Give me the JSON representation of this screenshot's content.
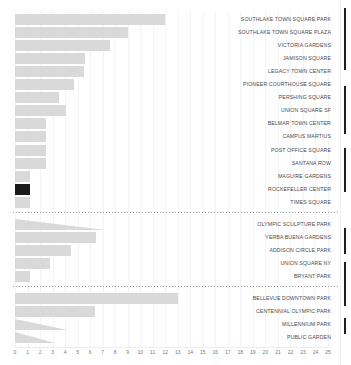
{
  "chart_data": {
    "type": "bar",
    "orientation": "horizontal",
    "title": "",
    "xlabel": "",
    "ylabel": "",
    "xlim": [
      0,
      25
    ],
    "grid": true,
    "legend": null,
    "tick_step": 1,
    "tick_labels": [
      "0",
      "1",
      "2",
      "3",
      "4",
      "5",
      "6",
      "7",
      "8",
      "9",
      "10",
      "11",
      "12",
      "13",
      "14",
      "15",
      "16",
      "17",
      "18",
      "19",
      "20",
      "21",
      "22",
      "23",
      "24",
      "25"
    ],
    "categories": [
      "SOUTHLAKE TOWN SQUARE PARK",
      "SOUTHLAKE TOWN SQUARE PLAZA",
      "VICTORIA GARDENS",
      "JAMISON SQUARE",
      "LEGACY TOWN CENTER",
      "PIONEER COURTHOUSE SQUARE",
      "PERSHING SQUARE",
      "UNION SQUARE SF",
      "BELMAR TOWN CENTER",
      "CAMPUS MARTIUS",
      "POST OFFICE SQUARE",
      "SANTANA ROW",
      "MAGUIRE GARDENS",
      "ROCKEFELLER CENTER",
      "TIMES SQUARE",
      "OLYMPIC SCULPTURE PARK",
      "YERBA BUENA GARDENS",
      "ADDISON CIRCLE PARK",
      "UNION SQUARE NY",
      "BRYANT PARK",
      "BELLEVUE DOWNTOWN PARK",
      "CENTENNIAL OLYMPIC PARK",
      "MILLENNIUM PARK",
      "PUBLIC GARDEN"
    ],
    "values": [
      12.0,
      9.0,
      7.6,
      5.6,
      5.5,
      4.7,
      3.5,
      4.1,
      2.5,
      2.5,
      2.5,
      2.5,
      1.2,
      1.2,
      1.2,
      7.2,
      6.5,
      4.5,
      2.8,
      1.2,
      13.0,
      6.4,
      4.2,
      3.2
    ],
    "bar_colors": [
      "#d9d9d9",
      "#d9d9d9",
      "#d9d9d9",
      "#d9d9d9",
      "#d9d9d9",
      "#d9d9d9",
      "#d9d9d9",
      "#d9d9d9",
      "#d9d9d9",
      "#d9d9d9",
      "#d9d9d9",
      "#d9d9d9",
      "#d9d9d9",
      "#1a1a1a",
      "#d9d9d9",
      "#d9d9d9",
      "#d9d9d9",
      "#d9d9d9",
      "#d9d9d9",
      "#d9d9d9",
      "#d9d9d9",
      "#d9d9d9",
      "#d9d9d9",
      "#d9d9d9"
    ],
    "selected_category": "ROCKEFELLER CENTER",
    "wedge_categories": [
      "OLYMPIC SCULPTURE PARK",
      "MILLENNIUM PARK",
      "PUBLIC GARDEN"
    ],
    "separator_after": [
      "TIMES SQUARE",
      "BRYANT PARK"
    ]
  },
  "colors": {
    "bar_default": "#d9d9d9",
    "bar_selected": "#1a1a1a",
    "gridline": "#f2f4f7",
    "label_text": "#4a4a4a",
    "tick_text": "#777777",
    "separator": "#9a9a9a",
    "background": "#ffffff",
    "scrollbar_thumb": "#1f1f1f"
  },
  "scrollbar": {
    "name": "vertical-scrollbar",
    "thumbs": [
      {
        "top": 8,
        "height": 62
      },
      {
        "top": 86,
        "height": 48
      },
      {
        "top": 148,
        "height": 44
      },
      {
        "top": 228,
        "height": 26
      },
      {
        "top": 262,
        "height": 44
      },
      {
        "top": 318,
        "height": 16
      }
    ]
  }
}
